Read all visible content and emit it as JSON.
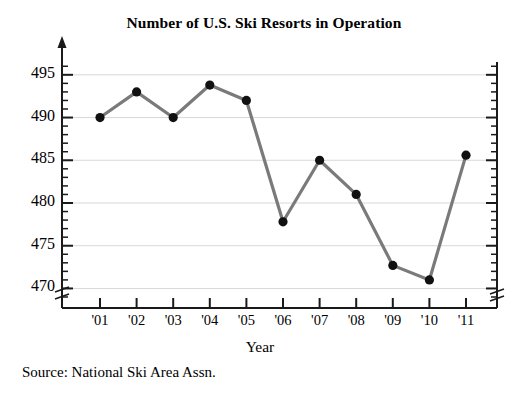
{
  "chart_data": {
    "type": "line",
    "title": "Number of U.S. Ski Resorts in Operation",
    "xlabel": "Year",
    "ylabel": "",
    "categories": [
      "'01",
      "'02",
      "'03",
      "'04",
      "'05",
      "'06",
      "'07",
      "'08",
      "'09",
      "'10",
      "'11"
    ],
    "values": [
      490,
      493,
      490,
      493.8,
      492,
      477.8,
      485,
      481,
      472.7,
      471,
      485.6
    ],
    "ylim": [
      469,
      496.5
    ],
    "ytick_labels": [
      "470",
      "475",
      "480",
      "485",
      "490",
      "495"
    ],
    "ytick_values": [
      470,
      475,
      480,
      485,
      490,
      495
    ],
    "minor_tick_step": 1,
    "grid": "horizontal-major",
    "legend": "none",
    "axis_break_x": true,
    "axis_break_y": true,
    "line_color": "#7a7a7a",
    "marker_color": "#111111",
    "grid_color": "#d8d8d8",
    "axis_color": "#1a1a1a"
  },
  "source": {
    "note": "Source: National Ski Area Assn."
  }
}
